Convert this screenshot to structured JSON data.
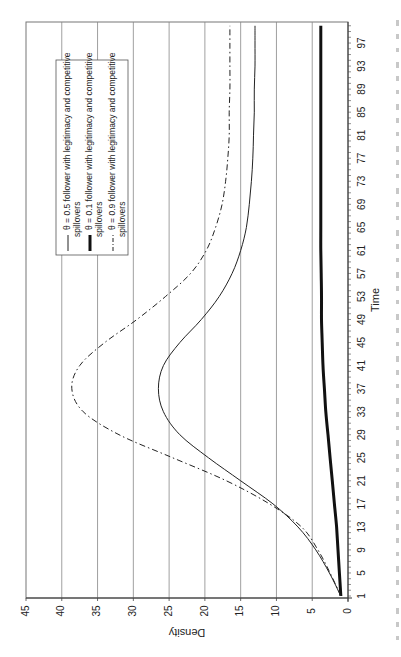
{
  "chart_data": {
    "type": "line",
    "orientation": "rotated-90-ccw",
    "title": "",
    "xlabel": "Time",
    "ylabel": "Density",
    "xlim": [
      1,
      100
    ],
    "ylim": [
      0,
      45
    ],
    "grid": {
      "y_major": true,
      "x_major": false
    },
    "legend_position": "upper-left (in rotated view)",
    "x_ticks": [
      1,
      5,
      9,
      13,
      17,
      21,
      25,
      29,
      33,
      37,
      41,
      45,
      49,
      53,
      57,
      61,
      65,
      69,
      73,
      77,
      81,
      85,
      89,
      93,
      97
    ],
    "y_ticks": [
      0,
      5,
      10,
      15,
      20,
      25,
      30,
      35,
      40,
      45
    ],
    "x": [
      1,
      5,
      9,
      13,
      17,
      21,
      25,
      29,
      33,
      37,
      41,
      45,
      49,
      53,
      57,
      61,
      65,
      69,
      73,
      77,
      81,
      85,
      89,
      93,
      97,
      100
    ],
    "series": [
      {
        "name": "θ = 0.5 follower with legitimacy and competitive spillovers",
        "style": "thin-solid",
        "values": [
          1.0,
          2.6,
          4.5,
          7.0,
          10.5,
          15.0,
          19.5,
          23.5,
          25.8,
          26.5,
          25.8,
          23.5,
          20.5,
          18.0,
          16.2,
          15.0,
          14.2,
          13.8,
          13.5,
          13.3,
          13.2,
          13.1,
          13.1,
          13.0,
          13.0,
          13.0
        ]
      },
      {
        "name": "θ = 0.1 follower with legitimacy and competitive spillovers",
        "style": "thick-solid",
        "values": [
          1.0,
          1.2,
          1.4,
          1.6,
          1.9,
          2.2,
          2.5,
          2.8,
          3.1,
          3.3,
          3.5,
          3.6,
          3.7,
          3.7,
          3.75,
          3.8,
          3.8,
          3.8,
          3.8,
          3.8,
          3.8,
          3.8,
          3.8,
          3.8,
          3.8,
          3.8
        ]
      },
      {
        "name": "θ = 0.9 follower with legitimacy and competitive spillovers",
        "style": "dash-dot",
        "values": [
          1.0,
          2.5,
          4.2,
          6.5,
          11.0,
          17.0,
          24.5,
          32.0,
          37.0,
          38.6,
          37.5,
          34.0,
          29.5,
          25.5,
          22.0,
          19.8,
          18.5,
          17.6,
          17.1,
          16.8,
          16.6,
          16.6,
          16.5,
          16.5,
          16.5,
          16.5
        ]
      }
    ]
  },
  "legend": {
    "items": [
      {
        "line1": "θ = 0.5 follower with legitimacy and competitive",
        "line2": "spillovers",
        "style": "thin-solid"
      },
      {
        "line1": "θ = 0.1 follower with legitimacy and competitive",
        "line2": "spillovers",
        "style": "thick-solid"
      },
      {
        "line1": "θ = 0.9 follower with legitimacy and competitive",
        "line2": "spillovers",
        "style": "dash-dot"
      }
    ]
  },
  "axes": {
    "x_title": "Time",
    "y_title": "Density"
  },
  "colors": {
    "line": "#222222",
    "grid": "#888888",
    "frame": "#777777",
    "background": "#ffffff"
  }
}
